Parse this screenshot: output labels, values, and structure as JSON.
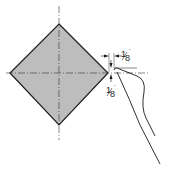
{
  "diagram": {
    "shape": "square rotated 45 degrees (diamond)",
    "fill_color": "#bdbdbd",
    "stroke_color": "#1a1a1a",
    "dimensions": [
      {
        "id": "horizontal-gap",
        "numerator": "1",
        "denominator": "8",
        "unit": "\""
      },
      {
        "id": "vertical-gap",
        "numerator": "1",
        "denominator": "8",
        "unit": "\""
      }
    ]
  }
}
